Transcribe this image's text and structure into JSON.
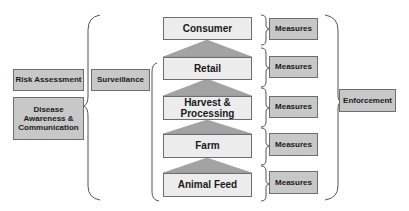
{
  "diagram": {
    "left": {
      "risk_assessment": "Risk Assessment",
      "disease_awareness": "Disease Awareness & Communication"
    },
    "surveillance": "Surveillance",
    "chain": [
      {
        "label": "Consumer"
      },
      {
        "label": "Retail"
      },
      {
        "label": "Harvest & Processing"
      },
      {
        "label": "Farm"
      },
      {
        "label": "Animal Feed"
      }
    ],
    "measures": [
      {
        "label": "Measures"
      },
      {
        "label": "Measures"
      },
      {
        "label": "Measures"
      },
      {
        "label": "Measures"
      },
      {
        "label": "Measures"
      }
    ],
    "enforcement": "Enforcement",
    "colors": {
      "gray_box": "#c8c8c8",
      "light_box": "#ececec",
      "triangle": "#a3a3a3",
      "border": "#6e6e6e"
    }
  }
}
